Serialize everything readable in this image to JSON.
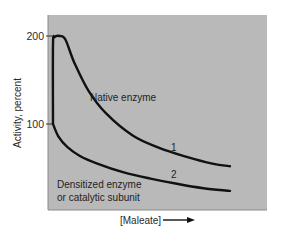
{
  "chart_data": {
    "type": "line",
    "title": "",
    "xlabel": "[Maleate]",
    "ylabel": "Activity, percent",
    "x_units": "relative (no ticks shown)",
    "xlim": [
      0,
      1
    ],
    "ylim": [
      60,
      210
    ],
    "yticks": [
      100,
      200
    ],
    "ytick_labels": [
      "200",
      "100"
    ],
    "grid": false,
    "legend": "none (inline annotations)",
    "series": [
      {
        "name": "Native enzyme",
        "id_label": "1",
        "points": [
          [
            0.0,
            100
          ],
          [
            0.0,
            190
          ],
          [
            0.01,
            199
          ],
          [
            0.04,
            200
          ],
          [
            0.07,
            196
          ],
          [
            0.12,
            170
          ],
          [
            0.2,
            138
          ],
          [
            0.3,
            112
          ],
          [
            0.45,
            87
          ],
          [
            0.6,
            73
          ],
          [
            0.75,
            63
          ],
          [
            0.9,
            55
          ],
          [
            1.0,
            52
          ]
        ]
      },
      {
        "name": "Densitized enzyme or catalytic subunit",
        "id_label": "2",
        "points": [
          [
            0.0,
            100
          ],
          [
            0.03,
            86
          ],
          [
            0.08,
            74
          ],
          [
            0.15,
            64
          ],
          [
            0.25,
            55
          ],
          [
            0.4,
            45
          ],
          [
            0.55,
            38
          ],
          [
            0.7,
            32
          ],
          [
            0.85,
            27
          ],
          [
            1.0,
            24
          ]
        ]
      }
    ],
    "annotations": {
      "native": "Native enzyme",
      "desensitized_line1": "Densitized enzyme",
      "desensitized_line2": "or catalytic subunit",
      "curve1_number": "1",
      "curve2_number": "2",
      "x_arrow": "arrow-right"
    }
  }
}
